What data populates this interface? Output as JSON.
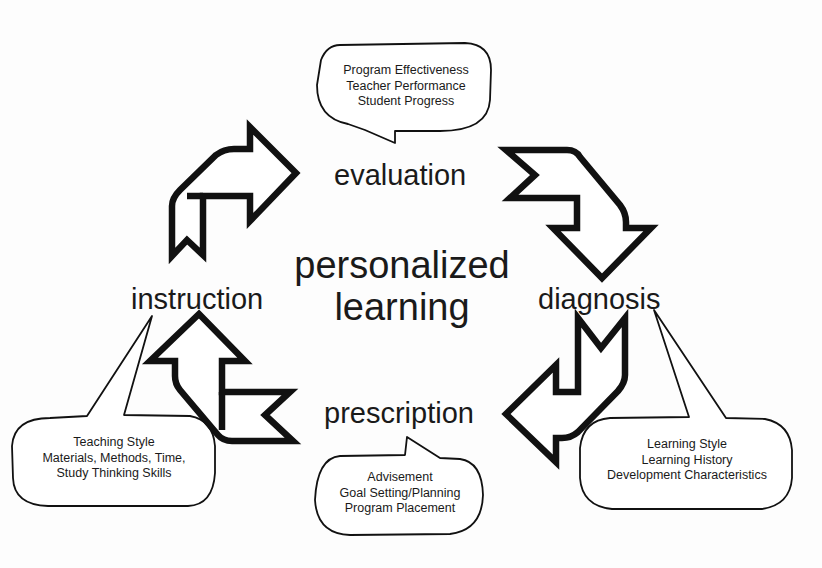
{
  "diagram": {
    "center": {
      "line1": "personalized",
      "line2": "learning"
    },
    "stages": {
      "evaluation": "evaluation",
      "diagnosis": "diagnosis",
      "prescription": "prescription",
      "instruction": "instruction"
    },
    "callouts": {
      "evaluation": [
        "Program Effectiveness",
        "Teacher Performance",
        "Student Progress"
      ],
      "diagnosis": [
        "Learning Style",
        "Learning History",
        "Development Characteristics"
      ],
      "prescription": [
        "Advisement",
        "Goal Setting/Planning",
        "Program Placement"
      ],
      "instruction": [
        "Teaching Style",
        "Materials, Methods, Time,",
        "Study Thinking Skills"
      ]
    },
    "cycle_order": [
      "evaluation",
      "diagnosis",
      "prescription",
      "instruction"
    ],
    "arrows": [
      {
        "from": "instruction",
        "to": "evaluation",
        "direction": "up-right",
        "icon": "arrow-up-right-icon"
      },
      {
        "from": "evaluation",
        "to": "diagnosis",
        "direction": "right-down",
        "icon": "arrow-right-down-icon"
      },
      {
        "from": "diagnosis",
        "to": "prescription",
        "direction": "down-left",
        "icon": "arrow-down-left-icon"
      },
      {
        "from": "prescription",
        "to": "instruction",
        "direction": "left-up",
        "icon": "arrow-left-up-icon"
      }
    ],
    "colors": {
      "stroke": "#111111",
      "fill": "#ffffff",
      "text": "#1a1a1a",
      "background": "#fdfdfd"
    }
  }
}
